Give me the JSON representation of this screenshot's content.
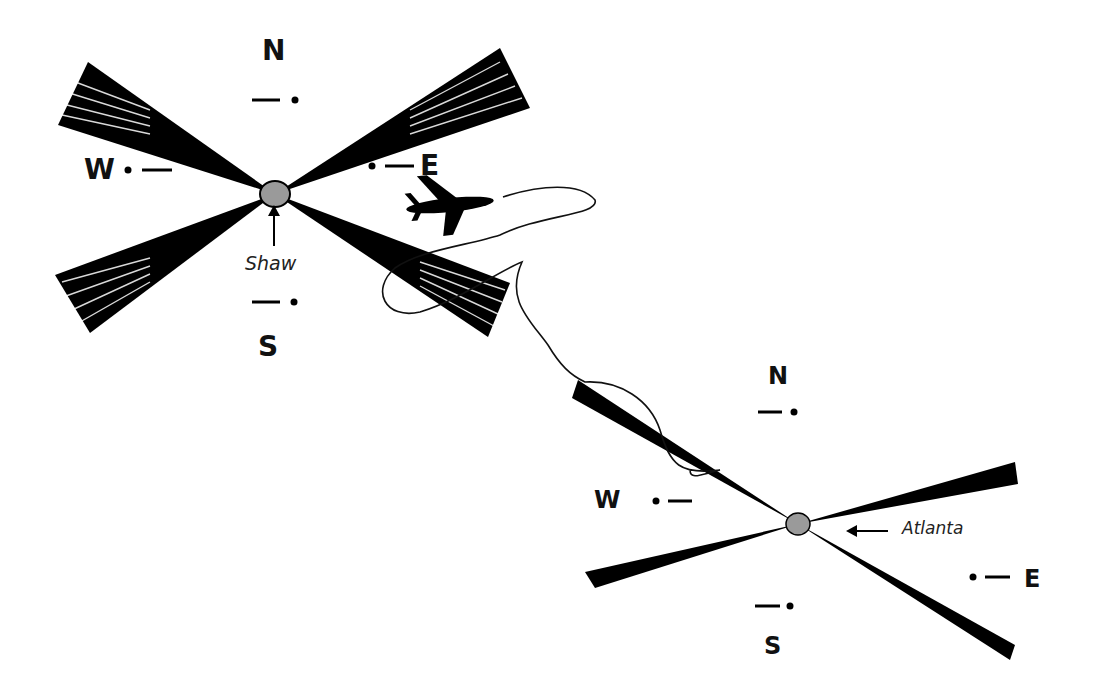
{
  "stations": [
    {
      "name": "Shaw",
      "center": [
        275,
        194
      ],
      "labels": {
        "N": "N",
        "S": "S",
        "E": "E",
        "W": "W"
      },
      "morse": {
        "N": "— •",
        "S": "— •",
        "E": "• —",
        "W": "• —"
      },
      "fill_color": "#9a9a9a"
    },
    {
      "name": "Atlanta",
      "center": [
        798,
        524
      ],
      "labels": {
        "N": "N",
        "S": "S",
        "E": "E",
        "W": "W"
      },
      "morse": {
        "N": "— •",
        "S": "— •",
        "E": "• —",
        "W": "• —"
      },
      "fill_color": "#9a9a9a"
    }
  ],
  "aircraft": {
    "icon": "airplane-icon"
  },
  "flight_path": {
    "description": "wandering course line from aircraft toward Atlanta station"
  }
}
